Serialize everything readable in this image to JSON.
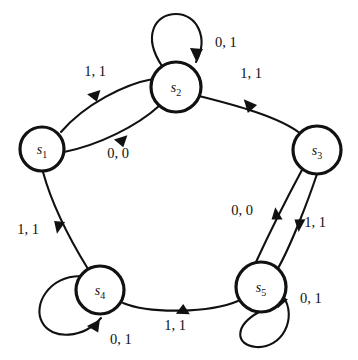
{
  "diagram": {
    "type": "finite-state-machine",
    "background_color": "#ffffff",
    "stroke_color": "#111111",
    "states": [
      {
        "id": "s1",
        "label": "s",
        "subscript": "1",
        "cx": 42,
        "cy": 149,
        "r": 22
      },
      {
        "id": "s2",
        "label": "s",
        "subscript": "2",
        "cx": 176,
        "cy": 87,
        "r": 25
      },
      {
        "id": "s3",
        "label": "s",
        "subscript": "3",
        "cx": 317,
        "cy": 150,
        "r": 24
      },
      {
        "id": "s4",
        "label": "s",
        "subscript": "4",
        "cx": 100,
        "cy": 290,
        "r": 24
      },
      {
        "id": "s5",
        "label": "s",
        "subscript": "5",
        "cx": 261,
        "cy": 287,
        "r": 25
      }
    ],
    "transitions": [
      {
        "id": "t1",
        "from": "s1",
        "to": "s2",
        "label": "1, 1",
        "label_x": 95,
        "label_y": 76
      },
      {
        "id": "t2",
        "from": "s1",
        "to": "s2",
        "label": "0, 0",
        "label_x": 118,
        "label_y": 158
      },
      {
        "id": "t3",
        "from": "s2",
        "to": "s3",
        "label": "1, 1",
        "label_x": 251,
        "label_y": 78
      },
      {
        "id": "t4",
        "from": "s3",
        "to": "s5",
        "label": "0, 0",
        "label_x": 242,
        "label_y": 215
      },
      {
        "id": "t5",
        "from": "s5",
        "to": "s3",
        "label": "1, 1",
        "label_x": 315,
        "label_y": 227
      },
      {
        "id": "t6",
        "from": "s4",
        "to": "s1",
        "label": "1, 1",
        "label_x": 28,
        "label_y": 234
      },
      {
        "id": "t7",
        "from": "s5",
        "to": "s4",
        "label": "1, 1",
        "label_x": 175,
        "label_y": 330
      },
      {
        "id": "t8",
        "from": "s2",
        "to": "s2",
        "label": "0, 1",
        "label_x": 215,
        "label_y": 47,
        "self_loop": true
      },
      {
        "id": "t9",
        "from": "s4",
        "to": "s4",
        "label": "0, 1",
        "label_x": 110,
        "label_y": 344,
        "self_loop": true
      },
      {
        "id": "t10",
        "from": "s5",
        "to": "s5",
        "label": "0, 1",
        "label_x": 300,
        "label_y": 303,
        "self_loop": true
      }
    ]
  }
}
